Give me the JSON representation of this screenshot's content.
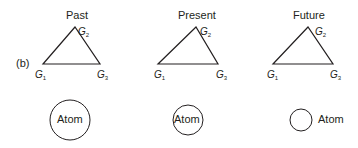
{
  "panel_label": "(b)",
  "columns": [
    {
      "title": "Past",
      "vertices": [
        "G",
        "G",
        "G"
      ],
      "subs": [
        "1",
        "2",
        "3"
      ],
      "atom_label": "Atom"
    },
    {
      "title": "Present",
      "vertices": [
        "G",
        "G",
        "G"
      ],
      "subs": [
        "1",
        "2",
        "3"
      ],
      "atom_label": "Atom"
    },
    {
      "title": "Future",
      "vertices": [
        "G",
        "G",
        "G"
      ],
      "subs": [
        "1",
        "2",
        "3"
      ],
      "atom_label": "Atom"
    }
  ],
  "colors": {
    "stroke": "#231f20",
    "background": "#ffffff"
  }
}
